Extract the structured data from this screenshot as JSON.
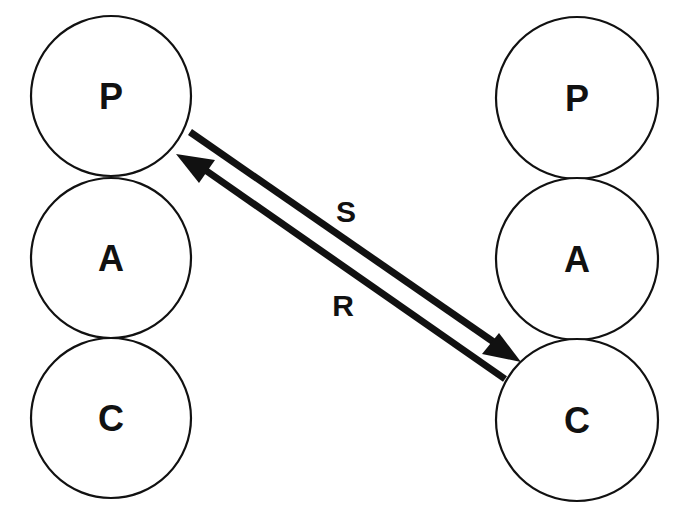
{
  "diagram": {
    "type": "transactional-analysis-complementary-transaction",
    "left_person": {
      "states": [
        {
          "label": "P",
          "cx": 111,
          "cy": 96,
          "r": 80
        },
        {
          "label": "A",
          "cx": 111,
          "cy": 258,
          "r": 80
        },
        {
          "label": "C",
          "cx": 111,
          "cy": 418,
          "r": 80
        }
      ]
    },
    "right_person": {
      "states": [
        {
          "label": "P",
          "cx": 577,
          "cy": 98,
          "r": 81
        },
        {
          "label": "A",
          "cx": 577,
          "cy": 259,
          "r": 81
        },
        {
          "label": "C",
          "cx": 577,
          "cy": 420,
          "r": 81
        }
      ]
    },
    "arrows": [
      {
        "label": "S",
        "from": "left.P",
        "to": "right.C"
      },
      {
        "label": "R",
        "from": "right.C",
        "to": "left.P"
      }
    ],
    "colors": {
      "stroke": "#111111",
      "background": "#ffffff"
    }
  }
}
